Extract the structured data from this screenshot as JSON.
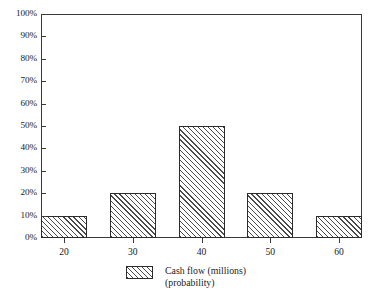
{
  "chart_data": {
    "type": "bar",
    "title": "",
    "subtitle": "",
    "xlabel": "",
    "ylabel": "",
    "categories": [
      "20",
      "30",
      "40",
      "50",
      "60"
    ],
    "values": [
      10,
      20,
      50,
      20,
      10
    ],
    "value_labels": [
      "10%",
      "20%",
      "50%",
      "20%",
      "10%"
    ],
    "ylim": [
      0,
      100
    ],
    "ytick_values": [
      0,
      10,
      20,
      30,
      40,
      50,
      60,
      70,
      80,
      90,
      100
    ],
    "ytick_labels": [
      "0%",
      "10%",
      "20%",
      "30%",
      "40%",
      "50%",
      "60%",
      "70%",
      "80%",
      "90%",
      "100%"
    ],
    "grid": false,
    "legend_position": "bottom-center",
    "series": [
      {
        "name": "Cash flow (millions) (probability)",
        "values": [
          10,
          20,
          50,
          20,
          10
        ]
      }
    ],
    "legend": [
      {
        "line1": "Cash flow (millions)",
        "line2": "(probability)",
        "swatch": "diagonal-hatch"
      }
    ],
    "annotations": []
  },
  "legend": {
    "line1": "Cash flow (millions)",
    "line2": "(probability)"
  },
  "colors": {
    "frame": "#3a3a3a",
    "bar_outline": "#2b2b2b",
    "bar_hatch": "#4a4a4a",
    "bar_fill": "#ffffff",
    "background": "#ffffff",
    "text": "#1a1a1a"
  }
}
